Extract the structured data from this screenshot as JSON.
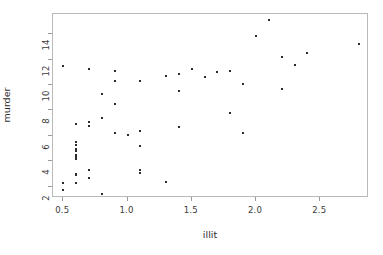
{
  "chart_data": {
    "type": "scatter",
    "title": "",
    "xlabel": "illit",
    "ylabel": "murder",
    "xlim": [
      0.42,
      2.88
    ],
    "ylim": [
      1.1,
      15.6
    ],
    "grid": false,
    "legend": null,
    "xticks": [
      "0.5",
      "1.0",
      "1.5",
      "2.0",
      "2.5"
    ],
    "xtick_values": [
      0.5,
      1.0,
      1.5,
      2.0,
      2.5
    ],
    "yticks": [
      "2",
      "4",
      "6",
      "8",
      "10",
      "12",
      "14"
    ],
    "ytick_values": [
      2,
      4,
      6,
      8,
      10,
      12,
      14
    ],
    "marker": "point",
    "marker_color": "#2b2b2b",
    "box_color": "#b9b9b9",
    "points": [
      {
        "x": 2.1,
        "y": 15.1
      },
      {
        "x": 0.7,
        "y": 11.3
      },
      {
        "x": 1.8,
        "y": 7.8
      },
      {
        "x": 1.9,
        "y": 10.1
      },
      {
        "x": 0.5,
        "y": 11.5
      },
      {
        "x": 0.7,
        "y": 6.8
      },
      {
        "x": 1.1,
        "y": 3.1
      },
      {
        "x": 0.9,
        "y": 6.2
      },
      {
        "x": 1.3,
        "y": 10.7
      },
      {
        "x": 2.0,
        "y": 13.9
      },
      {
        "x": 1.9,
        "y": 6.2
      },
      {
        "x": 0.6,
        "y": 5.3
      },
      {
        "x": 0.9,
        "y": 10.3
      },
      {
        "x": 0.7,
        "y": 7.1
      },
      {
        "x": 0.5,
        "y": 2.3
      },
      {
        "x": 0.6,
        "y": 4.5
      },
      {
        "x": 1.6,
        "y": 10.6
      },
      {
        "x": 2.8,
        "y": 13.2
      },
      {
        "x": 0.7,
        "y": 2.7
      },
      {
        "x": 0.9,
        "y": 8.5
      },
      {
        "x": 1.1,
        "y": 3.3
      },
      {
        "x": 0.9,
        "y": 11.1
      },
      {
        "x": 0.6,
        "y": 2.3
      },
      {
        "x": 2.4,
        "y": 12.5
      },
      {
        "x": 0.8,
        "y": 9.3
      },
      {
        "x": 0.6,
        "y": 5.0
      },
      {
        "x": 0.6,
        "y": 2.9
      },
      {
        "x": 0.5,
        "y": 11.5
      },
      {
        "x": 0.7,
        "y": 3.3
      },
      {
        "x": 1.1,
        "y": 5.2
      },
      {
        "x": 2.2,
        "y": 9.7
      },
      {
        "x": 1.4,
        "y": 10.9
      },
      {
        "x": 1.8,
        "y": 11.1
      },
      {
        "x": 0.8,
        "y": 1.4
      },
      {
        "x": 0.8,
        "y": 7.4
      },
      {
        "x": 1.1,
        "y": 6.4
      },
      {
        "x": 0.6,
        "y": 4.2
      },
      {
        "x": 1.0,
        "y": 6.1
      },
      {
        "x": 1.3,
        "y": 2.4
      },
      {
        "x": 2.3,
        "y": 11.6
      },
      {
        "x": 0.5,
        "y": 1.7
      },
      {
        "x": 1.7,
        "y": 11.0
      },
      {
        "x": 2.2,
        "y": 12.2
      },
      {
        "x": 0.6,
        "y": 4.5
      },
      {
        "x": 0.6,
        "y": 5.5
      },
      {
        "x": 1.4,
        "y": 9.5
      },
      {
        "x": 0.6,
        "y": 4.3
      },
      {
        "x": 1.4,
        "y": 6.7
      },
      {
        "x": 0.6,
        "y": 3.0
      },
      {
        "x": 0.6,
        "y": 6.9
      },
      {
        "x": 1.1,
        "y": 10.3
      },
      {
        "x": 1.5,
        "y": 11.3
      },
      {
        "x": 0.6,
        "y": 4.8
      }
    ]
  }
}
